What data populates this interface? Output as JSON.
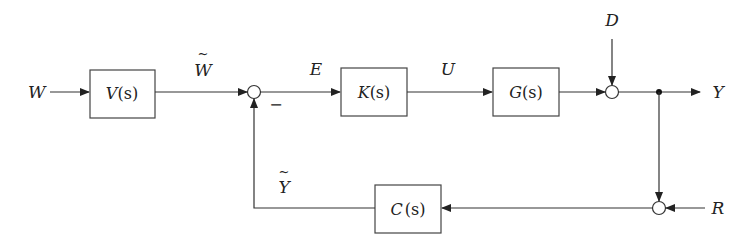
{
  "diagram": {
    "type": "control-system-block-diagram",
    "signals": {
      "W": "W",
      "W_tilde": "W",
      "E": "E",
      "U": "U",
      "D": "D",
      "Y": "Y",
      "Y_tilde": "Y",
      "R": "R",
      "minus_sign": "−",
      "tilde": "~"
    },
    "blocks": [
      {
        "id": "V",
        "name": "V",
        "arg": "(s)"
      },
      {
        "id": "K",
        "name": "K",
        "arg": "(s)"
      },
      {
        "id": "G",
        "name": "G",
        "arg": "(s)"
      },
      {
        "id": "C",
        "name": "C",
        "arg": "(s)"
      }
    ],
    "summing_junctions": [
      {
        "id": "sum1",
        "inputs": [
          "W_tilde",
          "Y_tilde (−)"
        ],
        "output": "E"
      },
      {
        "id": "sum2",
        "inputs": [
          "G output",
          "D"
        ],
        "output": "Y"
      },
      {
        "id": "sum3",
        "inputs": [
          "Y",
          "R"
        ],
        "output": "C input"
      }
    ],
    "connections": [
      "W -> V(s)",
      "V(s) -> sum1 (W~)",
      "sum1 -> K(s) (E)",
      "K(s) -> G(s) (U)",
      "G(s) -> sum2",
      "D -> sum2",
      "sum2 -> Y",
      "Y -> sum3",
      "R -> sum3",
      "sum3 -> C(s)",
      "C(s) -> sum1 (Y~, negative)"
    ]
  }
}
